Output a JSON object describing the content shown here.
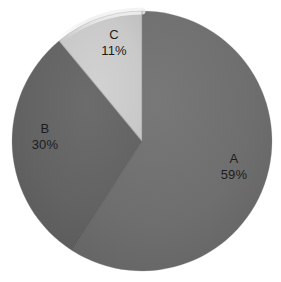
{
  "chart_data": {
    "type": "pie",
    "title": "",
    "subtitle": "",
    "xlabel": "",
    "ylabel": "",
    "categories": [
      "A",
      "B",
      "C"
    ],
    "values": [
      59,
      30,
      11
    ],
    "value_unit": "%",
    "slices": [
      {
        "label": "A",
        "percent_text": "59%",
        "value": 59,
        "color": "#6e6e6e"
      },
      {
        "label": "B",
        "percent_text": "30%",
        "value": 30,
        "color": "#636363"
      },
      {
        "label": "C",
        "percent_text": "11%",
        "value": 11,
        "color": "#c9c9c9"
      }
    ],
    "legend": {
      "visible": false,
      "position": "none"
    },
    "grid": false,
    "start_angle_deg": 0,
    "direction": "clockwise",
    "labels_inside_slices": true,
    "background_color": "#ffffff",
    "label_text_color": "#1c1c1c"
  },
  "geometry": {
    "center_x": 142,
    "center_y": 141,
    "radius": 130
  }
}
